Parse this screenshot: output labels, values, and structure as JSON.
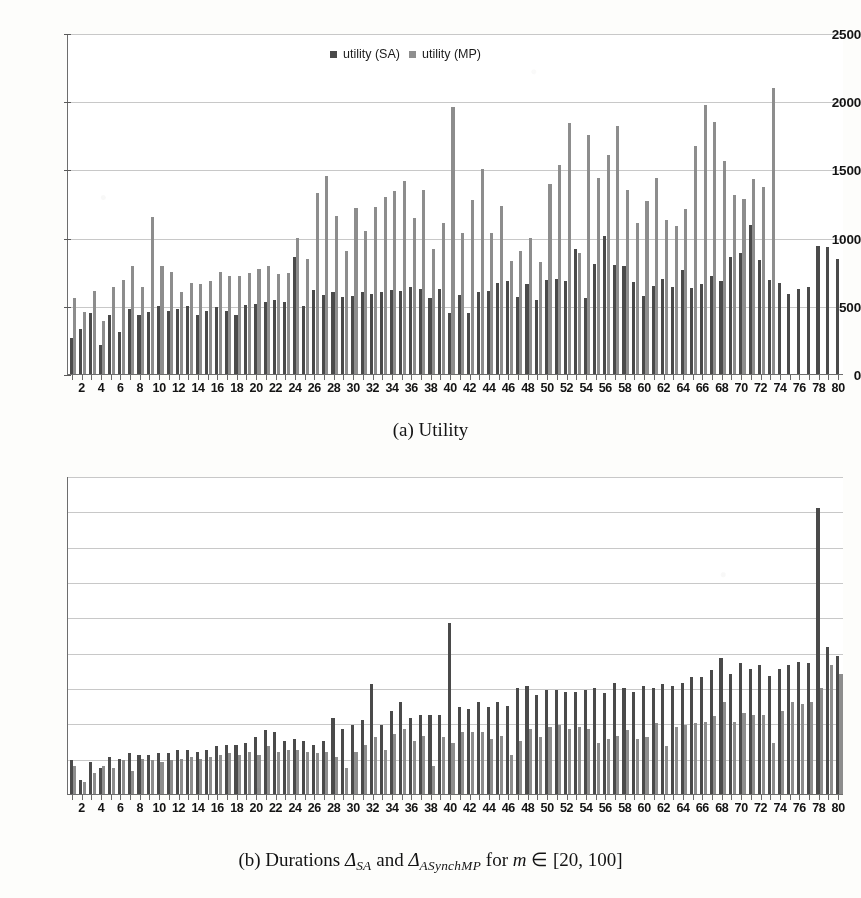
{
  "figure": {
    "caption_a": "(a) Utility",
    "caption_b_prefix": "(b) Durations ",
    "caption_b_sym1": "Δ",
    "caption_b_sub1": "SA",
    "caption_b_and": " and ",
    "caption_b_sym2": "Δ",
    "caption_b_sub2": "ASynchMP",
    "caption_b_mid": " for ",
    "caption_b_var": "m",
    "caption_b_in": " ∈ ",
    "caption_b_range": "[20, 100]"
  },
  "colors": {
    "sa": "#4a4a4a",
    "mp": "#8d8d8d",
    "grid": "#c8c8c8",
    "axis": "#6d6d6d",
    "paper": "#fdfdfb",
    "plot_bg": "#ffffff"
  },
  "chart_data": [
    {
      "id": "utility",
      "type": "bar",
      "title": "(a) Utility",
      "xlabel": "",
      "ylabel": "",
      "ylim": [
        0,
        2500
      ],
      "yticks": [
        0,
        500,
        1000,
        1500,
        2000,
        2500
      ],
      "grid": true,
      "legend_position": "top-center",
      "x": [
        1,
        2,
        3,
        4,
        5,
        6,
        7,
        8,
        9,
        10,
        11,
        12,
        13,
        14,
        15,
        16,
        17,
        18,
        19,
        20,
        21,
        22,
        23,
        24,
        25,
        26,
        27,
        28,
        29,
        30,
        31,
        32,
        33,
        34,
        35,
        36,
        37,
        38,
        39,
        40,
        41,
        42,
        43,
        44,
        45,
        46,
        47,
        48,
        49,
        50,
        51,
        52,
        53,
        54,
        55,
        56,
        57,
        58,
        59,
        60,
        61,
        62,
        63,
        64,
        65,
        66,
        67,
        68,
        69,
        70,
        71,
        72,
        73,
        74,
        75,
        76,
        77,
        78,
        79,
        80
      ],
      "xtick_labels": [
        2,
        4,
        6,
        8,
        10,
        12,
        14,
        16,
        18,
        20,
        22,
        24,
        26,
        28,
        30,
        32,
        34,
        36,
        38,
        40,
        42,
        44,
        46,
        48,
        50,
        52,
        54,
        56,
        58,
        60,
        62,
        64,
        66,
        68,
        70,
        72,
        74,
        76,
        78,
        80
      ],
      "series": [
        {
          "name": "utility (SA)",
          "color": "#4a4a4a",
          "values": [
            265,
            330,
            450,
            210,
            430,
            310,
            480,
            430,
            455,
            500,
            460,
            480,
            495,
            430,
            460,
            490,
            465,
            435,
            505,
            510,
            525,
            540,
            530,
            855,
            500,
            615,
            580,
            600,
            565,
            575,
            600,
            590,
            600,
            615,
            605,
            640,
            620,
            555,
            620,
            445,
            580,
            445,
            600,
            610,
            670,
            680,
            565,
            660,
            545,
            690,
            700,
            685,
            920,
            555,
            810,
            1010,
            800,
            790,
            675,
            570,
            645,
            700,
            640,
            765,
            630,
            660,
            720,
            680,
            860,
            890,
            1095,
            835,
            690,
            665,
            585,
            625,
            640,
            935,
            930,
            840
          ]
        },
        {
          "name": "utility (MP)",
          "color": "#8d8d8d",
          "values": [
            560,
            455,
            610,
            390,
            640,
            690,
            790,
            635,
            1150,
            790,
            745,
            600,
            665,
            660,
            685,
            750,
            720,
            720,
            740,
            770,
            790,
            735,
            740,
            1000,
            840,
            1325,
            1450,
            1155,
            900,
            1220,
            1045,
            1225,
            1300,
            1345,
            1415,
            1145,
            1350,
            920,
            1110,
            1960,
            1035,
            1275,
            1505,
            1035,
            1230,
            830,
            900,
            1000,
            820,
            1395,
            1530,
            1840,
            885,
            1755,
            1440,
            1605,
            1815,
            1350,
            1105,
            1270,
            1435,
            1130,
            1085,
            1210,
            1675,
            1975,
            1850,
            1560,
            1310,
            1285,
            1430,
            1370,
            2095
          ]
        }
      ]
    },
    {
      "id": "durations",
      "type": "bar",
      "title": "(b) Durations",
      "xlabel": "",
      "ylabel": "",
      "ylim": [
        0,
        90
      ],
      "yticks": [
        0,
        10,
        20,
        30,
        40,
        50,
        60,
        70,
        80,
        90
      ],
      "grid": true,
      "legend_position": "top-center",
      "x": [
        1,
        2,
        3,
        4,
        5,
        6,
        7,
        8,
        9,
        10,
        11,
        12,
        13,
        14,
        15,
        16,
        17,
        18,
        19,
        20,
        21,
        22,
        23,
        24,
        25,
        26,
        27,
        28,
        29,
        30,
        31,
        32,
        33,
        34,
        35,
        36,
        37,
        38,
        39,
        40,
        41,
        42,
        43,
        44,
        45,
        46,
        47,
        48,
        49,
        50,
        51,
        52,
        53,
        54,
        55,
        56,
        57,
        58,
        59,
        60,
        61,
        62,
        63,
        64,
        65,
        66,
        67,
        68,
        69,
        70,
        71,
        72,
        73,
        74,
        75,
        76,
        77,
        78,
        79,
        80
      ],
      "xtick_labels": [
        2,
        4,
        6,
        8,
        10,
        12,
        14,
        16,
        18,
        20,
        22,
        24,
        26,
        28,
        30,
        32,
        34,
        36,
        38,
        40,
        42,
        44,
        46,
        48,
        50,
        52,
        54,
        56,
        58,
        60,
        62,
        64,
        66,
        68,
        70,
        72,
        74,
        76,
        78,
        80
      ],
      "series": [
        {
          "name": "duration (SA)",
          "color": "#4a4a4a",
          "values": [
            9.5,
            4.0,
            9.0,
            7.5,
            10.5,
            10.0,
            11.5,
            11.0,
            11.0,
            11.5,
            11.5,
            12.5,
            12.5,
            12.0,
            12.5,
            13.5,
            14.0,
            14.0,
            14.5,
            16.0,
            18.0,
            17.5,
            15.0,
            15.5,
            15.0,
            14.0,
            15.0,
            21.5,
            18.5,
            19.5,
            21.0,
            31.0,
            19.5,
            23.5,
            26.0,
            21.5,
            22.5,
            22.5,
            22.5,
            48.5,
            24.5,
            24.0,
            26.0,
            24.5,
            26.0,
            25.0,
            30.0,
            30.5,
            28.0,
            29.5,
            29.5,
            29.0,
            29.0,
            29.5,
            30.0,
            28.5,
            31.5,
            30.0,
            29.0,
            30.5,
            30.0,
            31.0,
            30.5,
            31.5,
            33.0,
            33.0,
            35.0,
            38.5,
            34.0,
            37.0,
            35.5,
            36.5,
            33.5,
            35.5,
            36.5,
            37.5,
            37.0,
            81.0,
            41.5,
            39.0
          ]
        },
        {
          "name": "duration (MP)",
          "color": "#8d8d8d",
          "values": [
            8.0,
            3.5,
            6.0,
            8.0,
            7.5,
            9.5,
            6.5,
            10.0,
            9.5,
            9.0,
            9.5,
            10.0,
            10.5,
            10.0,
            10.5,
            11.0,
            11.5,
            11.0,
            12.0,
            11.0,
            13.5,
            12.0,
            12.5,
            12.5,
            12.0,
            11.5,
            12.0,
            10.5,
            7.5,
            12.0,
            14.0,
            16.0,
            12.5,
            17.0,
            18.5,
            15.0,
            16.5,
            8.0,
            16.0,
            14.5,
            17.5,
            17.5,
            17.5,
            15.5,
            16.5,
            11.0,
            15.0,
            18.5,
            16.0,
            19.0,
            19.5,
            18.5,
            19.0,
            18.5,
            14.5,
            15.5,
            16.5,
            18.0,
            15.5,
            16.0,
            20.0,
            13.5,
            19.0,
            19.5,
            20.0,
            20.5,
            22.0,
            26.0,
            20.5,
            23.0,
            22.5,
            22.5,
            14.5,
            23.5,
            26.0,
            25.5,
            26.0,
            30.0,
            36.5,
            34.0
          ]
        }
      ]
    }
  ],
  "legends": {
    "a": [
      {
        "label": "utility (SA)",
        "swatch": "sa"
      },
      {
        "label": "utility (MP)",
        "swatch": "mp"
      }
    ],
    "b": [
      {
        "label": "duration (SA)",
        "swatch": "sa"
      },
      {
        "label": "duration (MP)",
        "swatch": "mp"
      }
    ]
  }
}
